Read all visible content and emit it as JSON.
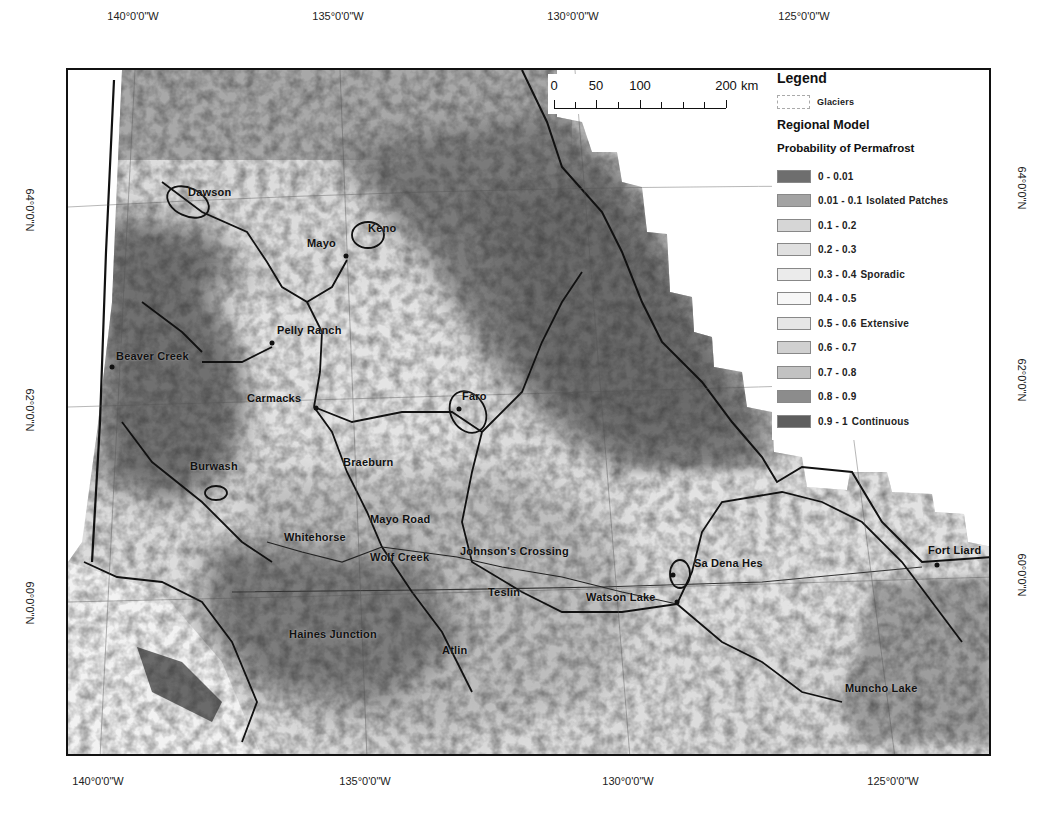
{
  "graticule": {
    "top": [
      {
        "label": "140°0'0\"W",
        "x": 133
      },
      {
        "label": "135°0'0\"W",
        "x": 338
      },
      {
        "label": "130°0'0\"W",
        "x": 573
      },
      {
        "label": "125°0'0\"W",
        "x": 804
      }
    ],
    "bottom": [
      {
        "label": "140°0'0\"W",
        "x": 98
      },
      {
        "label": "135°0'0\"W",
        "x": 365
      },
      {
        "label": "130°0'0\"W",
        "x": 628
      },
      {
        "label": "125°0'0\"W",
        "x": 893
      }
    ],
    "left": [
      {
        "label": "64°0'0\"N",
        "y": 210
      },
      {
        "label": "62°0'0\"N",
        "y": 410
      },
      {
        "label": "60°0'0\"N",
        "y": 603
      }
    ],
    "right": [
      {
        "label": "64°0'0\"N",
        "y": 188
      },
      {
        "label": "62°0'0\"N",
        "y": 380
      },
      {
        "label": "60°0'0\"N",
        "y": 575
      }
    ]
  },
  "scale_bar": {
    "ticks": [
      {
        "label": "0",
        "x": 6
      },
      {
        "label": "50",
        "x": 48
      },
      {
        "label": "100",
        "x": 92
      },
      {
        "label": "200",
        "x": 178
      }
    ],
    "unit": "km"
  },
  "legend": {
    "title": "Legend",
    "glacier_label": "Glaciers",
    "model_title": "Regional Model",
    "probability_title": "Probability of Permafrost",
    "classes": [
      {
        "range": "0 - 0.01",
        "zone": "",
        "color": "#6e6e6e"
      },
      {
        "range": "0.01 - 0.1",
        "zone": "Isolated Patches",
        "color": "#a3a3a3"
      },
      {
        "range": "0.1 - 0.2",
        "zone": "",
        "color": "#d6d6d6"
      },
      {
        "range": "0.2 - 0.3",
        "zone": "",
        "color": "#e0e0e0"
      },
      {
        "range": "0.3 - 0.4",
        "zone": "Sporadic",
        "color": "#ebebeb"
      },
      {
        "range": "0.4 - 0.5",
        "zone": "",
        "color": "#f7f7f7"
      },
      {
        "range": "0.5 - 0.6",
        "zone": "Extensive",
        "color": "#e6e6e6"
      },
      {
        "range": "0.6 - 0.7",
        "zone": "",
        "color": "#d0d0d0"
      },
      {
        "range": "0.7 - 0.8",
        "zone": "",
        "color": "#c2c2c2"
      },
      {
        "range": "0.8 - 0.9",
        "zone": "",
        "color": "#8c8c8c"
      },
      {
        "range": "0.9 - 1",
        "zone": "Continuous",
        "color": "#5e5e5e"
      }
    ]
  },
  "places": [
    {
      "name": "Dawson",
      "x": 188,
      "y": 192,
      "dot": null
    },
    {
      "name": "Keno",
      "x": 368,
      "y": 228,
      "dot": null
    },
    {
      "name": "Mayo",
      "x": 307,
      "y": 243,
      "dot": {
        "x": 346,
        "y": 256
      }
    },
    {
      "name": "Pelly Ranch",
      "x": 277,
      "y": 330,
      "dot": {
        "x": 272,
        "y": 343
      }
    },
    {
      "name": "Beaver Creek",
      "x": 116,
      "y": 356,
      "dot": {
        "x": 112,
        "y": 367
      }
    },
    {
      "name": "Carmacks",
      "x": 247,
      "y": 398,
      "dot": {
        "x": 316,
        "y": 408
      }
    },
    {
      "name": "Faro",
      "x": 462,
      "y": 396,
      "dot": {
        "x": 459,
        "y": 409
      }
    },
    {
      "name": "Burwash",
      "x": 190,
      "y": 466,
      "dot": null
    },
    {
      "name": "Braeburn",
      "x": 343,
      "y": 462,
      "dot": null
    },
    {
      "name": "Mayo Road",
      "x": 370,
      "y": 519,
      "dot": null
    },
    {
      "name": "Whitehorse",
      "x": 284,
      "y": 537,
      "dot": null
    },
    {
      "name": "Wolf Creek",
      "x": 370,
      "y": 557,
      "dot": null
    },
    {
      "name": "Johnson's Crossing",
      "x": 460,
      "y": 551,
      "dot": null
    },
    {
      "name": "Sa Dena Hes",
      "x": 694,
      "y": 563,
      "dot": {
        "x": 673,
        "y": 575
      }
    },
    {
      "name": "Teslin",
      "x": 488,
      "y": 592,
      "dot": null
    },
    {
      "name": "Watson Lake",
      "x": 586,
      "y": 597,
      "dot": {
        "x": 677,
        "y": 602
      }
    },
    {
      "name": "Haines Junction",
      "x": 289,
      "y": 634,
      "dot": null
    },
    {
      "name": "Atlin",
      "x": 442,
      "y": 650,
      "dot": null
    },
    {
      "name": "Fort Liard",
      "x": 928,
      "y": 550,
      "dot": {
        "x": 937,
        "y": 565
      }
    },
    {
      "name": "Muncho Lake",
      "x": 845,
      "y": 688,
      "dot": null
    }
  ]
}
